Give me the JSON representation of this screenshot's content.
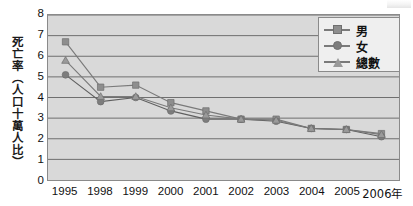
{
  "chart_data": {
    "type": "line",
    "title": "",
    "xlabel": "",
    "ylabel": "死亡率（人口十萬人比）",
    "categories": [
      "1995",
      "1998",
      "1999",
      "2000",
      "2001",
      "2002",
      "2003",
      "2004",
      "2005",
      "2006年"
    ],
    "ylim": [
      0,
      8
    ],
    "yticks": [
      0,
      1,
      2,
      3,
      4,
      5,
      6,
      7,
      8
    ],
    "grid": true,
    "legend_position": "top-right",
    "series": [
      {
        "name": "男",
        "marker": "square",
        "color": "#8e8e8e",
        "values": [
          6.7,
          4.5,
          4.6,
          3.75,
          3.35,
          2.95,
          2.95,
          2.5,
          2.45,
          2.25
        ]
      },
      {
        "name": "女",
        "marker": "circle",
        "color": "#7d7d7d",
        "values": [
          5.1,
          3.8,
          4.0,
          3.35,
          2.95,
          2.95,
          2.85,
          2.5,
          2.45,
          2.1
        ]
      },
      {
        "name": "總數",
        "marker": "triangle",
        "color": "#9a9a9a",
        "values": [
          5.8,
          4.05,
          4.05,
          3.5,
          3.15,
          2.95,
          2.9,
          2.5,
          2.45,
          2.2
        ]
      }
    ]
  },
  "legend": {
    "items": [
      {
        "label": "男"
      },
      {
        "label": "女"
      },
      {
        "label": "總數"
      }
    ]
  },
  "colors": {
    "plot_background": "#d9d9d9",
    "grid_line": "#6f6f6f",
    "axis_line": "#8a8a8a",
    "legend_background": "#efefef",
    "text": "#111111"
  }
}
